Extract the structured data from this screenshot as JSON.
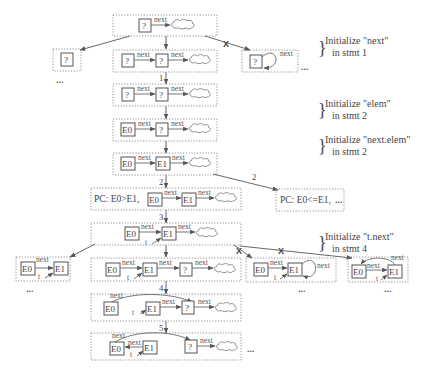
{
  "diagram": {
    "annotations": [
      {
        "id": "init-next",
        "line1": "Initialize \"next\"",
        "line2": "in stmt 1",
        "x": 365,
        "y": 22
      },
      {
        "id": "init-elem",
        "line1": "Initialize \"elem\"",
        "line2": "in stmt 2",
        "x": 365,
        "y": 102
      },
      {
        "id": "init-next-elem",
        "line1": "Initialize \"next.elem\"",
        "line2": "in stmt 2",
        "x": 365,
        "y": 140
      },
      {
        "id": "init-t-next",
        "line1": "Initialize \"t.next\"",
        "line2": "in stmt 4",
        "x": 365,
        "y": 232
      }
    ],
    "edge_labels": {
      "next": "next",
      "t": "t",
      "unknown": "?",
      "e0": "E0",
      "e1": "E1",
      "ellipsis": "...",
      "x": "X"
    },
    "steps": [
      "1",
      "2",
      "2",
      "3",
      "4",
      "5"
    ],
    "path_conditions": {
      "gt": "PC: E0>E1,",
      "le": "PC: E0<=E1,"
    },
    "states": [
      {
        "id": "s0",
        "desc": "? -next-> cloud"
      },
      {
        "id": "s1-null",
        "desc": "? (next = null)"
      },
      {
        "id": "s1-new",
        "desc": "? -next-> ? -next-> cloud"
      },
      {
        "id": "s1-self",
        "desc": "? with self-loop next"
      },
      {
        "id": "s2",
        "desc": "? -next-> ? -next-> cloud"
      },
      {
        "id": "s3",
        "desc": "E0 -next-> ? -next-> cloud"
      },
      {
        "id": "s4",
        "desc": "E0 -next-> E1 -next-> cloud"
      },
      {
        "id": "s5-gt",
        "desc": "PC: E0>E1, E0 -next-> E1 -next-> cloud"
      },
      {
        "id": "s5-le",
        "desc": "PC: E0<=E1, ..."
      },
      {
        "id": "s6",
        "desc": "E0 -next-> E1 (t) -next-> cloud"
      },
      {
        "id": "s7-null",
        "desc": "E0 -next-> E1 (t), next null"
      },
      {
        "id": "s7-new",
        "desc": "E0 -next-> E1 -next-> ? -next-> cloud"
      },
      {
        "id": "s7-self",
        "desc": "E0 -next-> E1 self-loop"
      },
      {
        "id": "s7-back",
        "desc": "E0 <-> E1 cycle"
      },
      {
        "id": "s8",
        "desc": "E0 -next-> ?, t -> E1 -next-> ?"
      },
      {
        "id": "s9",
        "desc": "E1 -next-> E0 -next-> ? -next-> cloud"
      }
    ]
  }
}
